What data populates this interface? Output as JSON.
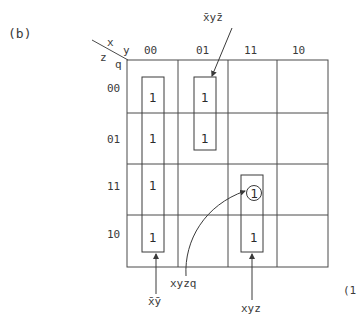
{
  "figure": {
    "panel_label": "(b)",
    "clipped_right_label": "(1"
  },
  "kmap": {
    "corner": {
      "row_vars_top": "x",
      "col_vars_top": "y",
      "row_vars_bottom": "z",
      "col_vars_bottom": "q"
    },
    "column_headers": [
      "00",
      "01",
      "11",
      "10"
    ],
    "row_headers": [
      "00",
      "01",
      "11",
      "10"
    ],
    "cells": [
      [
        "1",
        "1",
        "",
        ""
      ],
      [
        "1",
        "1",
        "",
        ""
      ],
      [
        "1",
        "",
        "1",
        ""
      ],
      [
        "1",
        "",
        "1",
        ""
      ]
    ],
    "circled_cell": {
      "row": 2,
      "col": 2,
      "value": "1"
    }
  },
  "groups": [
    {
      "label": "x̄ȳ",
      "covers": "column 00, rows 00–10"
    },
    {
      "label": "x̄yz̄",
      "covers": "column 01, rows 00–01"
    },
    {
      "label": "xyz",
      "covers": "column 11, rows 11–10"
    },
    {
      "label": "xyzq",
      "covers": "circled cell column 11, row 11"
    }
  ],
  "annotations": {
    "top": "x̄yz̄",
    "bottom_left": "x̄ȳ",
    "bottom_middle": "xyzq",
    "bottom_right": "xyz"
  }
}
